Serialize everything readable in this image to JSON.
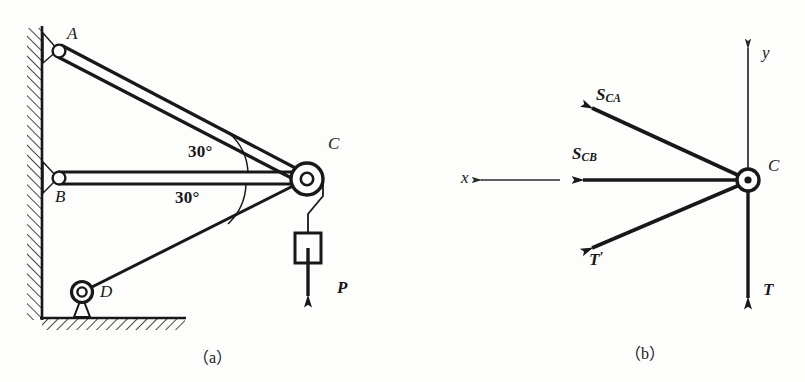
{
  "figure": {
    "title_panels": [
      {
        "id": "a",
        "caption": "（a）"
      },
      {
        "id": "b",
        "caption": "（b）"
      }
    ]
  },
  "panel_a": {
    "caption": "（a）",
    "joints": [
      {
        "name": "A",
        "label": "A",
        "type": "pin-on-wall",
        "x": 58,
        "y": 50
      },
      {
        "name": "B",
        "label": "B",
        "type": "pin-on-wall",
        "x": 58,
        "y": 178
      },
      {
        "name": "C",
        "label": "C",
        "type": "pulley",
        "x": 305,
        "y": 178
      },
      {
        "name": "D",
        "label": "D",
        "type": "pin-on-ground",
        "x": 82,
        "y": 295
      }
    ],
    "angles": [
      {
        "label": "30°",
        "between": "CA and CB",
        "x": 188,
        "y": 152
      },
      {
        "label": "30°",
        "between": "CB and CD",
        "x": 175,
        "y": 197
      }
    ],
    "load": {
      "label": "P",
      "label_x": 340,
      "label_y": 288,
      "block": {
        "x": 295,
        "y": 233,
        "w": 26,
        "h": 30
      }
    },
    "members": [
      {
        "name": "AC",
        "from": "A",
        "to": "C",
        "style": "double-line-bar"
      },
      {
        "name": "BC",
        "from": "B",
        "to": "C",
        "style": "double-line-bar"
      },
      {
        "name": "DC",
        "from": "D",
        "to": "C",
        "style": "single-line-rod"
      }
    ],
    "supports": {
      "wall": {
        "x": 42,
        "y_top": 28,
        "y_bottom": 318,
        "hatch_side": "left"
      },
      "ground": {
        "y": 318,
        "x_left": 42,
        "x_right": 185,
        "hatch_side": "below"
      }
    }
  },
  "panel_b": {
    "caption": "（b）",
    "origin": {
      "label": "C",
      "x": 748,
      "y": 180
    },
    "axes": [
      {
        "name": "y-axis",
        "label": "y",
        "direction": "up",
        "label_x": 762,
        "label_y": 50
      },
      {
        "name": "x-axis",
        "label": "x",
        "direction": "left",
        "label_x": 462,
        "label_y": 168
      }
    ],
    "forces": [
      {
        "name": "S_CA",
        "label": "S",
        "subscript": "CA",
        "direction": "up-left",
        "angle_deg": 30,
        "label_x": 592,
        "label_y": 88
      },
      {
        "name": "S_CB",
        "label": "S",
        "subscript": "CB",
        "direction": "left",
        "angle_deg": 0,
        "label_x": 570,
        "label_y": 147
      },
      {
        "name": "T_prime",
        "label": "T",
        "subscript": "",
        "prime": "′",
        "direction": "down-left",
        "angle_deg": -30,
        "label_x": 588,
        "label_y": 252
      },
      {
        "name": "T",
        "label": "T",
        "subscript": "",
        "direction": "down",
        "angle_deg": -90,
        "label_x": 762,
        "label_y": 288
      }
    ]
  },
  "colors": {
    "ink": "#17181a",
    "paper": "#fdfdfb",
    "thin": "#2a2b2d"
  }
}
